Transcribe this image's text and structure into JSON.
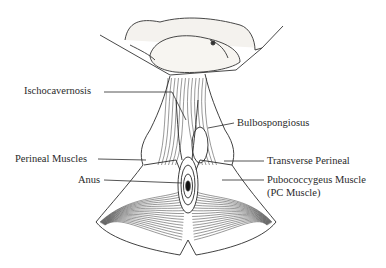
{
  "diagram": {
    "labels": {
      "ischocavernosis": "Ischocavernosis",
      "bulbospongiosus": "Bulbospongiosus",
      "perineal_muscles": "Perineal Muscles",
      "transverse_perineal": "Transverse Perineal",
      "anus": "Anus",
      "pc_muscle_line1": "Pubococcygeus Muscle",
      "pc_muscle_line2": "(PC Muscle)"
    },
    "colors": {
      "ink": "#2a2a2a",
      "background": "#ffffff"
    }
  }
}
